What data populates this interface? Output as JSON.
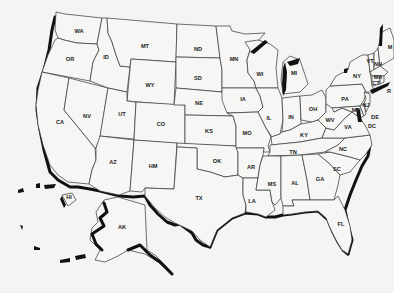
{
  "colors": {
    "background": "#f4f4f2",
    "border": "#333333",
    "coast_shadow": "#111111",
    "label": "#222222"
  },
  "states": [
    {
      "abbr": "WA",
      "x": 79,
      "y": 31
    },
    {
      "abbr": "OR",
      "x": 70,
      "y": 59
    },
    {
      "abbr": "ID",
      "x": 106,
      "y": 57
    },
    {
      "abbr": "MT",
      "x": 145,
      "y": 46
    },
    {
      "abbr": "WY",
      "x": 150,
      "y": 85
    },
    {
      "abbr": "CA",
      "x": 60,
      "y": 122
    },
    {
      "abbr": "NV",
      "x": 87,
      "y": 116
    },
    {
      "abbr": "UT",
      "x": 122,
      "y": 114
    },
    {
      "abbr": "CO",
      "x": 161,
      "y": 124
    },
    {
      "abbr": "AZ",
      "x": 113,
      "y": 162
    },
    {
      "abbr": "HM",
      "x": 153,
      "y": 166
    },
    {
      "abbr": "ND",
      "x": 198,
      "y": 49
    },
    {
      "abbr": "SD",
      "x": 198,
      "y": 78
    },
    {
      "abbr": "NE",
      "x": 199,
      "y": 103
    },
    {
      "abbr": "KS",
      "x": 209,
      "y": 131
    },
    {
      "abbr": "OK",
      "x": 217,
      "y": 161
    },
    {
      "abbr": "TX",
      "x": 199,
      "y": 198
    },
    {
      "abbr": "MN",
      "x": 234,
      "y": 59
    },
    {
      "abbr": "IA",
      "x": 243,
      "y": 99
    },
    {
      "abbr": "MO",
      "x": 247,
      "y": 133
    },
    {
      "abbr": "AR",
      "x": 251,
      "y": 167
    },
    {
      "abbr": "LA",
      "x": 252,
      "y": 201
    },
    {
      "abbr": "WI",
      "x": 260,
      "y": 74
    },
    {
      "abbr": "IL",
      "x": 269,
      "y": 118
    },
    {
      "abbr": "MI",
      "x": 294,
      "y": 73
    },
    {
      "abbr": "IN",
      "x": 291,
      "y": 117
    },
    {
      "abbr": "OH",
      "x": 313,
      "y": 109
    },
    {
      "abbr": "KY",
      "x": 304,
      "y": 135
    },
    {
      "abbr": "TN",
      "x": 293,
      "y": 152
    },
    {
      "abbr": "MS",
      "x": 272,
      "y": 184
    },
    {
      "abbr": "AL",
      "x": 295,
      "y": 183
    },
    {
      "abbr": "GA",
      "x": 320,
      "y": 179
    },
    {
      "abbr": "FL",
      "x": 341,
      "y": 224
    },
    {
      "abbr": "SC",
      "x": 337,
      "y": 169
    },
    {
      "abbr": "NC",
      "x": 343,
      "y": 149
    },
    {
      "abbr": "VA",
      "x": 348,
      "y": 127
    },
    {
      "abbr": "WV",
      "x": 330,
      "y": 120
    },
    {
      "abbr": "PA",
      "x": 345,
      "y": 99
    },
    {
      "abbr": "NY",
      "x": 357,
      "y": 76
    },
    {
      "abbr": "VT",
      "x": 370,
      "y": 61
    },
    {
      "abbr": "NH",
      "x": 378,
      "y": 64
    },
    {
      "abbr": "MA",
      "x": 378,
      "y": 77
    },
    {
      "abbr": "CT",
      "x": 376,
      "y": 83
    },
    {
      "abbr": "R",
      "x": 389,
      "y": 91
    },
    {
      "abbr": "NJ",
      "x": 366,
      "y": 105
    },
    {
      "abbr": "MD",
      "x": 356,
      "y": 110
    },
    {
      "abbr": "DE",
      "x": 375,
      "y": 117
    },
    {
      "abbr": "DC",
      "x": 372,
      "y": 126
    },
    {
      "abbr": "M",
      "x": 390,
      "y": 47
    },
    {
      "abbr": "HI",
      "x": 69,
      "y": 197
    },
    {
      "abbr": "AK",
      "x": 122,
      "y": 227
    }
  ]
}
